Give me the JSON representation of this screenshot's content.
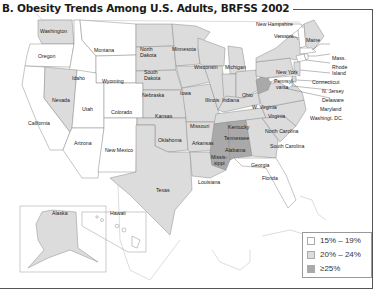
{
  "title": "B. Obesity Trends Among U.S. Adults, BRFSS 2002",
  "colors": {
    "low": "#ffffff",
    "mid": "#dcdcdc",
    "high": "#a9a9a9",
    "border": "#8a8a8a"
  },
  "legend": {
    "items": [
      {
        "label": "15% – 19%",
        "color": "#ffffff"
      },
      {
        "label": "20% – 24%",
        "color": "#dcdcdc"
      },
      {
        "label": "≥25%",
        "color": "#a9a9a9"
      }
    ]
  },
  "states": {
    "washington": "Washington",
    "oregon": "Oregon",
    "california": "California",
    "idaho": "Idaho",
    "nevada": "Nevada",
    "montana": "Montana",
    "wyoming": "Wyoming",
    "utah": "Utah",
    "arizona": "Arizona",
    "colorado": "Colorado",
    "new_mexico": "New Mexico",
    "north_dakota_1": "North",
    "north_dakota_2": "Dakota",
    "south_dakota_1": "South",
    "south_dakota_2": "Dakota",
    "nebraska": "Nebraska",
    "kansas": "Kansas",
    "oklahoma": "Oklahoma",
    "texas": "Texas",
    "minnesota": "Minnesota",
    "iowa": "Iowa",
    "missouri": "Missouri",
    "arkansas": "Arkansas",
    "louisiana": "Louisiana",
    "wisconsin": "Wisconsin",
    "illinois": "Illinois",
    "michigan": "Michigan",
    "indiana": "Indiana",
    "ohio": "Ohio",
    "kentucky": "Kentucky",
    "tennessee": "Tennessee",
    "mississippi_1": "Missis-",
    "mississippi_2": "sippi",
    "alabama": "Alabama",
    "georgia": "Georgia",
    "florida": "Florida",
    "south_carolina": "South Carolina",
    "north_carolina": "North Carolina",
    "virginia": "Virginia",
    "west_virginia": "W. Virginia",
    "pennsylvania_1": "Pennsyl-",
    "pennsylvania_2": "vania",
    "new_york": "New York",
    "vermont": "Vermont",
    "new_hampshire": "New Hampshire",
    "maine": "Maine",
    "massachusetts": "Mass.",
    "rhode_island_1": "Rhode",
    "rhode_island_2": "Island",
    "connecticut": "Connecticut",
    "new_jersey": "N. Jersey",
    "delaware": "Delaware",
    "maryland": "Maryland",
    "dc": "Washingt. DC.",
    "alaska": "Alaska",
    "hawaii": "Hawaii"
  }
}
